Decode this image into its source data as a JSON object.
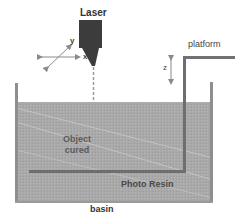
{
  "diagram": {
    "labels": {
      "laser": "Laser",
      "platform": "platform",
      "z_axis": "z",
      "x_axis": "x",
      "y_axis": "y",
      "object_line1": "Object",
      "object_line2": "cured",
      "resin": "Photo Resin",
      "basin": "basin"
    },
    "colors": {
      "laser_body": "#3c3c3c",
      "resin_fill": "#a8a8a8",
      "walls": "#8a8a8a",
      "platform": "#707070",
      "beam": "#9a9a9a",
      "text": "#3a3a3a"
    }
  }
}
